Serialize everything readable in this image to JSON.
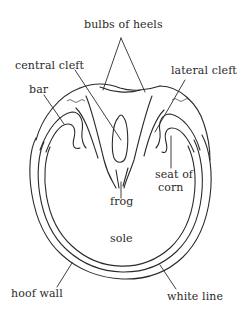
{
  "diagram": {
    "stroke_color": "#2a2a2a",
    "background": "#ffffff",
    "labels": {
      "bulbs_of_heels": "bulbs of heels",
      "central_cleft": "central cleft",
      "lateral_cleft": "lateral cleft",
      "bar": "bar",
      "seat_of_corn_line1": "seat of",
      "seat_of_corn_line2": "corn",
      "frog": "frog",
      "sole": "sole",
      "hoof_wall": "hoof wall",
      "white_line": "white line"
    }
  }
}
